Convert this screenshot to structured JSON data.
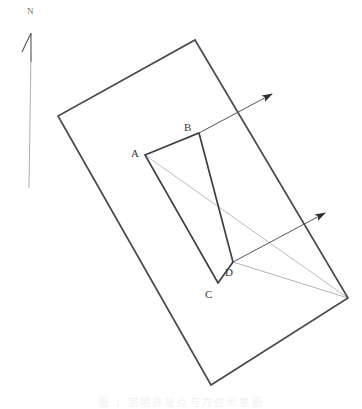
{
  "figure": {
    "width": 362,
    "height": 409,
    "background_color": "#ffffff"
  },
  "north_indicator": {
    "name": "north-arrow",
    "letter": "N",
    "letter_x": 27,
    "letter_y": 14,
    "chevron_color": "#54545a",
    "stem_color": "#8f8f96",
    "stem_top_y": 52,
    "stem_bottom_y": 188
  },
  "outer_boundary": {
    "name": "outer-parcel-boundary",
    "stroke_color": "#4a4a50",
    "stroke_width": 1.7,
    "points": [
      {
        "label": "top",
        "x": 195,
        "y": 40
      },
      {
        "label": "right",
        "x": 348,
        "y": 298
      },
      {
        "label": "bottom",
        "x": 211,
        "y": 385
      },
      {
        "label": "left",
        "x": 58,
        "y": 116
      }
    ]
  },
  "inner_rectangle": {
    "name": "inner-parcel-rectangle",
    "stroke_color": "#3e3e44",
    "stroke_width": 1.7,
    "corners": [
      {
        "label": "A",
        "x": 145,
        "y": 155,
        "label_x": 131,
        "label_y": 157
      },
      {
        "label": "B",
        "x": 199,
        "y": 133,
        "label_x": 184,
        "label_y": 131
      },
      {
        "label": "D",
        "x": 233,
        "y": 262,
        "label_x": 225,
        "label_y": 276
      },
      {
        "label": "C",
        "x": 218,
        "y": 283,
        "label_x": 205,
        "label_y": 298
      }
    ]
  },
  "bearing_arrows": [
    {
      "name": "bearing-arrow-upper",
      "from_label": "B",
      "from_x": 199,
      "from_y": 133,
      "to_x": 277,
      "to_y": 91,
      "stroke_color": "#55555c",
      "stroke_width": 1.0
    },
    {
      "name": "bearing-arrow-lower",
      "from_label": "D",
      "from_x": 233,
      "from_y": 262,
      "to_x": 330,
      "to_y": 210,
      "stroke_color": "#55555c",
      "stroke_width": 1.0
    }
  ],
  "convergence": {
    "name": "convergence-vertex",
    "x": 348,
    "y": 298,
    "thin_stroke_color": "#9a9aa0",
    "thin_stroke_width": 0.7,
    "rays": [
      {
        "name": "ray-from-corner-a",
        "from_x": 145,
        "from_y": 155
      },
      {
        "name": "ray-from-corner-d",
        "from_x": 233,
        "from_y": 262
      }
    ]
  },
  "caption": {
    "name": "figure-caption",
    "text": "图 1  宗地界址点与方位示意图",
    "visible": "faint"
  }
}
